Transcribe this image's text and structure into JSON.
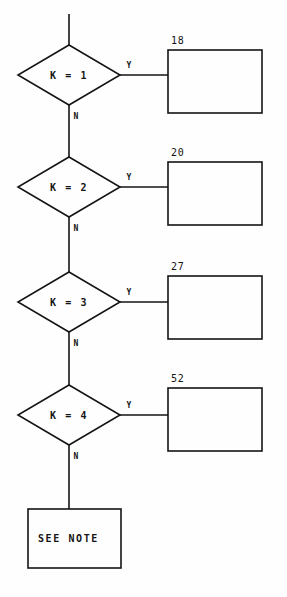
{
  "diagram": {
    "stroke_color": "#151515",
    "background_color": "#ffffff",
    "entry_connector": {
      "name": "entry-line"
    },
    "decisions": [
      {
        "id": "k1",
        "label": "K = 1",
        "yes_label": "Y",
        "no_label": "N",
        "target_box_number": "18"
      },
      {
        "id": "k2",
        "label": "K = 2",
        "yes_label": "Y",
        "no_label": "N",
        "target_box_number": "20"
      },
      {
        "id": "k3",
        "label": "K = 3",
        "yes_label": "Y",
        "no_label": "N",
        "target_box_number": "27"
      },
      {
        "id": "k4",
        "label": "K = 4",
        "yes_label": "Y",
        "no_label": "N",
        "target_box_number": "52"
      }
    ],
    "terminal_box": {
      "id": "see-note",
      "label": "SEE NOTE"
    }
  }
}
